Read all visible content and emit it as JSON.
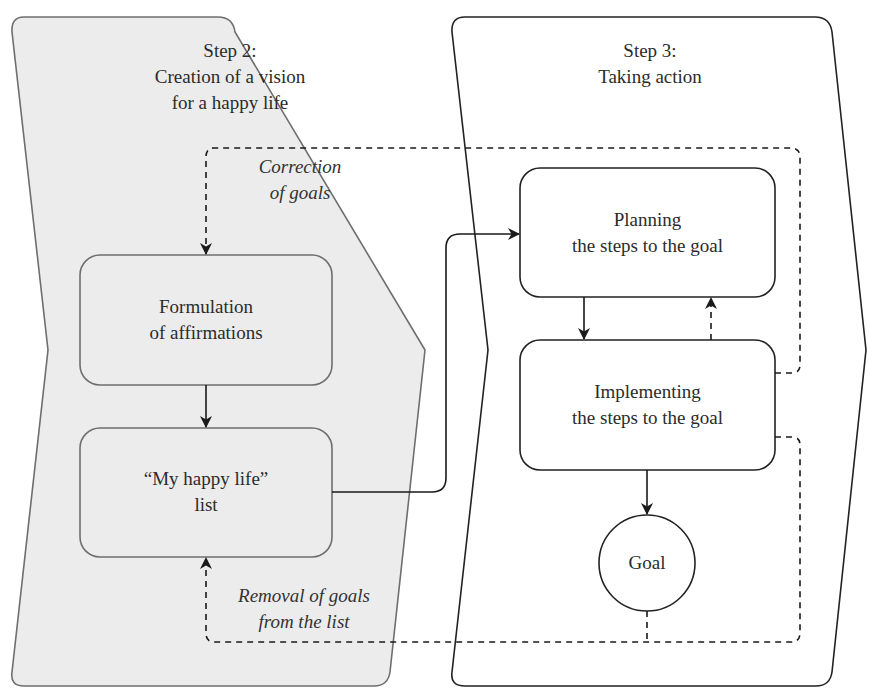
{
  "diagram": {
    "type": "flowchart",
    "colors": {
      "step2_fill": "#ececec",
      "step2_stroke": "#6e6e6e",
      "step3_fill": "#ffffff",
      "step3_stroke": "#222222",
      "arrow": "#1a1a1a",
      "text": "#2b2b2b"
    },
    "panels": [
      {
        "id": "step2",
        "title_line1": "Step 2:",
        "title_line2": "Creation of a vision",
        "title_line3": "for a happy life"
      },
      {
        "id": "step3",
        "title_line1": "Step 3:",
        "title_line2": "Taking action"
      }
    ],
    "nodes": [
      {
        "id": "formulation",
        "line1": "Formulation",
        "line2": "of affirmations"
      },
      {
        "id": "happy_list",
        "line1": "“My happy life”",
        "line2": "list"
      },
      {
        "id": "planning",
        "line1": "Planning",
        "line2": "the steps to the goal"
      },
      {
        "id": "implementing",
        "line1": "Implementing",
        "line2": "the steps to the goal"
      },
      {
        "id": "goal",
        "line1": "Goal"
      }
    ],
    "edge_labels": {
      "correction_line1": "Correction",
      "correction_line2": "of goals",
      "removal_line1": "Removal of goals",
      "removal_line2": "from the list"
    },
    "edges": [
      {
        "from": "formulation",
        "to": "happy_list",
        "style": "solid"
      },
      {
        "from": "happy_list",
        "to": "planning",
        "style": "solid"
      },
      {
        "from": "planning",
        "to": "implementing",
        "style": "solid"
      },
      {
        "from": "implementing",
        "to": "planning",
        "style": "dashed"
      },
      {
        "from": "implementing",
        "to": "goal",
        "style": "solid"
      },
      {
        "from": "implementing",
        "to": "formulation",
        "style": "dashed",
        "label": "Correction of goals"
      },
      {
        "from": "implementing",
        "to": "happy_list",
        "style": "dashed",
        "label": "Removal of goals from the list"
      },
      {
        "from": "goal",
        "to": "happy_list",
        "style": "dashed"
      }
    ]
  }
}
